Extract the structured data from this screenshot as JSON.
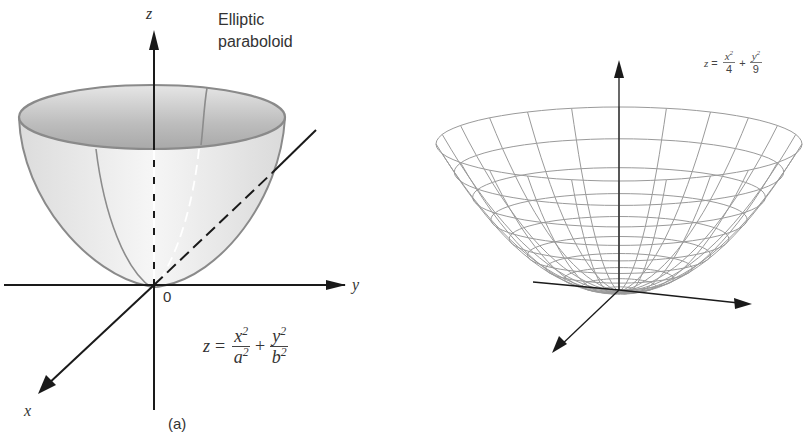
{
  "figure_a": {
    "title_line1": "Elliptic",
    "title_line2": "paraboloid",
    "axis_labels": {
      "z": "z",
      "y": "y",
      "x": "x"
    },
    "origin_label": "0",
    "caption": "(a)",
    "equation": {
      "lhs": "z",
      "eq": "=",
      "term1_num": "x",
      "term1_num_exp": "2",
      "term1_den": "a",
      "term1_den_exp": "2",
      "plus": "+",
      "term2_num": "y",
      "term2_num_exp": "2",
      "term2_den": "b",
      "term2_den_exp": "2"
    },
    "colors": {
      "axis": "#1a1a1a",
      "surface_edge": "#8a8a8a",
      "rim_fill": "#c9c9c9",
      "surface_fill": "#ececec"
    }
  },
  "figure_b": {
    "equation": {
      "lhs": "z",
      "eq": "=",
      "term1_num": "x",
      "term1_num_exp": "2",
      "term1_den": "4",
      "plus": "+",
      "term2_num": "y",
      "term2_num_exp": "2",
      "term2_den": "9"
    },
    "mesh": {
      "rings": 10,
      "meridians": 24,
      "a_squared": 4,
      "b_squared": 9
    },
    "colors": {
      "axis": "#1a1a1a",
      "mesh": "#9a9a9a"
    }
  }
}
